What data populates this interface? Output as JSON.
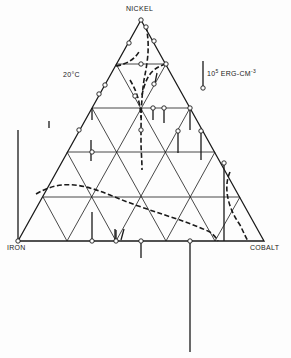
{
  "diagram": {
    "type": "ternary",
    "vertices": {
      "top": "NICKEL",
      "left": "IRON",
      "right": "COBALT"
    },
    "temperature": "20°C",
    "scale_legend": {
      "base": "10",
      "exponent": "5",
      "unit": "ERG-CM",
      "unit_exponent": "-3"
    },
    "grid_divisions": 5,
    "colors": {
      "line": "#1a1a1a",
      "background": "#fdfdfd"
    }
  }
}
